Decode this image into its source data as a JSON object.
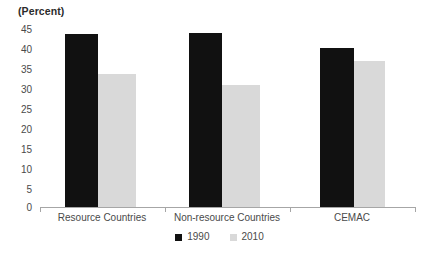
{
  "chart_data": {
    "type": "bar",
    "title": "(Percent)",
    "xlabel": "",
    "ylabel": "",
    "ylim": [
      0,
      45
    ],
    "ytick_step": 5,
    "yticks": [
      45,
      40,
      35,
      30,
      25,
      20,
      15,
      10,
      5,
      0
    ],
    "grid": false,
    "legend_position": "bottom-center",
    "categories": [
      "Resource Countries",
      "Non-resource Countries",
      "CEMAC"
    ],
    "series": [
      {
        "name": "1990",
        "color": "#111111",
        "values": [
          43.2,
          43.5,
          39.7
        ]
      },
      {
        "name": "2010",
        "color": "#d9d9d9",
        "values": [
          33.2,
          30.5,
          36.5
        ]
      }
    ]
  },
  "legend": {
    "items": [
      {
        "label": "1990"
      },
      {
        "label": "2010"
      }
    ]
  },
  "axis": {
    "y_labels": [
      "45",
      "40",
      "35",
      "30",
      "25",
      "20",
      "15",
      "10",
      "5",
      "0"
    ],
    "category_labels": [
      "Resource Countries",
      "Non-resource Countries",
      "CEMAC"
    ]
  }
}
